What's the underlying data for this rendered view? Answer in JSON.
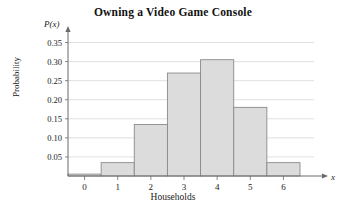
{
  "chart_data": {
    "type": "bar",
    "title": "Owning a Video Game Console",
    "xlabel": "Households",
    "ylabel": "Probability",
    "x_axis_variable": "x",
    "y_axis_variable": "P(x)",
    "categories": [
      "0",
      "1",
      "2",
      "3",
      "4",
      "5",
      "6"
    ],
    "values": [
      0.005,
      0.035,
      0.135,
      0.27,
      0.305,
      0.18,
      0.035
    ],
    "xlim": [
      -0.5,
      6.5
    ],
    "ylim": [
      0,
      0.375
    ],
    "y_ticks": [
      "0.05",
      "0.10",
      "0.15",
      "0.20",
      "0.25",
      "0.30",
      "0.35"
    ],
    "y_tick_values": [
      0.05,
      0.1,
      0.15,
      0.2,
      0.25,
      0.3,
      0.35
    ],
    "x_ticks": [
      "0",
      "1",
      "2",
      "3",
      "4",
      "5",
      "6"
    ],
    "grid": true,
    "legend": null,
    "bar_fill_color": "#dcdcdc",
    "bar_border_color": "#8a8a8a",
    "gridline_color": "#c9c9c9",
    "axis_color": "#6a6a6a"
  }
}
